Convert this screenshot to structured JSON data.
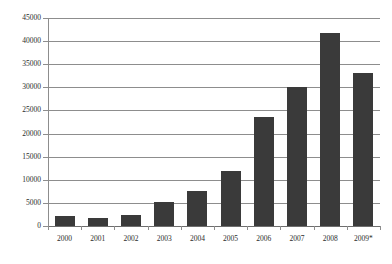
{
  "chart_data": {
    "type": "bar",
    "title": "",
    "subtitle": "",
    "xlabel": "",
    "ylabel": "",
    "categories": [
      "2000",
      "2001",
      "2002",
      "2003",
      "2004",
      "2005",
      "2006",
      "2007",
      "2008",
      "2009*"
    ],
    "values": [
      2100,
      1800,
      2300,
      5200,
      7500,
      11900,
      23500,
      30000,
      41700,
      33000
    ],
    "series": [
      {
        "name": "",
        "values": [
          2100,
          1800,
          2300,
          5200,
          7500,
          11900,
          23500,
          30000,
          41700,
          33000
        ]
      }
    ],
    "ylim": [
      0,
      45000
    ],
    "y_ticks": [
      0,
      5000,
      10000,
      15000,
      20000,
      25000,
      30000,
      35000,
      40000,
      45000
    ],
    "y_tick_labels": [
      "0",
      "5000",
      "10000",
      "15000",
      "20000",
      "25000",
      "30000",
      "35000",
      "40000",
      "45000"
    ],
    "grid": true,
    "grid_axis": "y",
    "legend": false,
    "legend_position": "none",
    "bar_color": "#3a3a3a",
    "grid_color": "#8d8d8d",
    "background_color": "#ffffff",
    "annotations": []
  }
}
